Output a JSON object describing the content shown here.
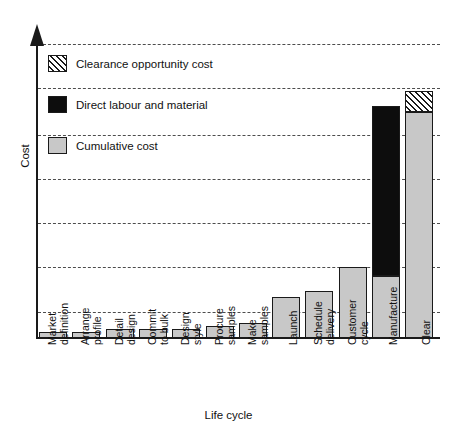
{
  "chart_data": {
    "type": "bar",
    "title": "",
    "xlabel": "Life cycle",
    "ylabel": "Cost",
    "stacked": true,
    "grid": true,
    "legend_position": "top-left-inside",
    "axis_tick_labels": [],
    "ylim": [
      0,
      100
    ],
    "categories": [
      "Market definition",
      "Arrange profile",
      "Detail design",
      "Commit to bulk",
      "Design style",
      "Procure samples",
      "Make samples",
      "Launch",
      "Schedule delivery",
      "Customer cycle",
      "Manufacture",
      "Clear"
    ],
    "series": [
      {
        "name": "Cumulative cost",
        "color": "#c8c8c8",
        "values": [
          2,
          2,
          3,
          3,
          3,
          4,
          5,
          14,
          16,
          24,
          21,
          77
        ]
      },
      {
        "name": "Direct labour and material",
        "color": "#0d0d0d",
        "values": [
          0,
          0,
          0,
          0,
          0,
          0,
          0,
          0,
          0,
          0,
          58,
          0
        ]
      },
      {
        "name": "Clearance opportunity cost",
        "color": "#ffffff",
        "pattern": "diagonal-hatch",
        "values": [
          0,
          0,
          0,
          0,
          0,
          0,
          0,
          0,
          0,
          0,
          0,
          7
        ]
      }
    ],
    "gridline_values": [
      100,
      85,
      69,
      54,
      39,
      24,
      9
    ]
  },
  "legend": {
    "items": [
      {
        "label": "Clearance opportunity cost",
        "swatch": "clearance"
      },
      {
        "label": "Direct labour and material",
        "swatch": "direct"
      },
      {
        "label": "Cumulative cost",
        "swatch": "cumulative"
      }
    ]
  },
  "axes": {
    "y_title": "Cost",
    "x_title": "Life cycle"
  },
  "category_label_lines": [
    [
      "Market",
      "definition"
    ],
    [
      "Arrange",
      "profile"
    ],
    [
      "Detail",
      "design"
    ],
    [
      "Commit",
      "to bulk"
    ],
    [
      "Design",
      "style"
    ],
    [
      "Procure",
      "samples"
    ],
    [
      "Make",
      "samples"
    ],
    [
      "Launch"
    ],
    [
      "Schedule",
      "delivery"
    ],
    [
      "Customer",
      "cycle"
    ],
    [
      "Manufacture"
    ],
    [
      "Clear"
    ]
  ]
}
